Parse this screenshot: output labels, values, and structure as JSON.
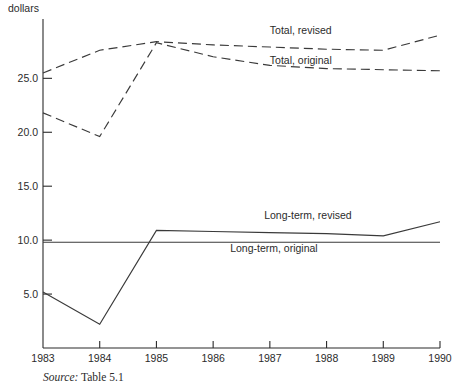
{
  "figure": {
    "source_note_prefix": "Source:",
    "source_note_text": "Table 5.1"
  },
  "chart_data": {
    "type": "line",
    "title": "",
    "xlabel": "",
    "ylabel": "dollars",
    "grid": false,
    "legend_position": "inline-annotations",
    "categories": [
      "1983",
      "1984",
      "1985",
      "1986",
      "1987",
      "1988",
      "1989",
      "1990"
    ],
    "x": [
      1983,
      1984,
      1985,
      1986,
      1987,
      1988,
      1989,
      1990
    ],
    "xlim": [
      1983,
      1990
    ],
    "ylim": [
      0.0,
      30.5
    ],
    "yticks": [
      5.0,
      10.0,
      15.0,
      20.0,
      25.0
    ],
    "ytick_labels": [
      "5.0",
      "10.0",
      "15.0",
      "20.0",
      "25.0"
    ],
    "series": [
      {
        "name": "Total, revised",
        "style": "dashed",
        "label_x": 1987.0,
        "label_y": 29.1,
        "values": [
          25.5,
          27.6,
          28.4,
          28.1,
          27.9,
          27.7,
          27.6,
          29.0
        ]
      },
      {
        "name": "Total, original",
        "style": "dashed",
        "label_x": 1987.0,
        "label_y": 26.3,
        "values": [
          21.8,
          19.6,
          28.3,
          27.0,
          26.2,
          25.9,
          25.8,
          25.7
        ]
      },
      {
        "name": "Long-term, revised",
        "style": "solid",
        "label_x": 1986.9,
        "label_y": 12.0,
        "values": [
          5.2,
          2.2,
          10.9,
          10.8,
          10.7,
          10.6,
          10.4,
          11.7
        ]
      },
      {
        "name": "Long-term, original",
        "style": "solid",
        "label_x": 1986.3,
        "label_y": 8.9,
        "values": [
          9.8,
          9.8,
          9.8,
          9.8,
          9.8,
          9.8,
          9.8,
          9.8
        ]
      }
    ]
  }
}
